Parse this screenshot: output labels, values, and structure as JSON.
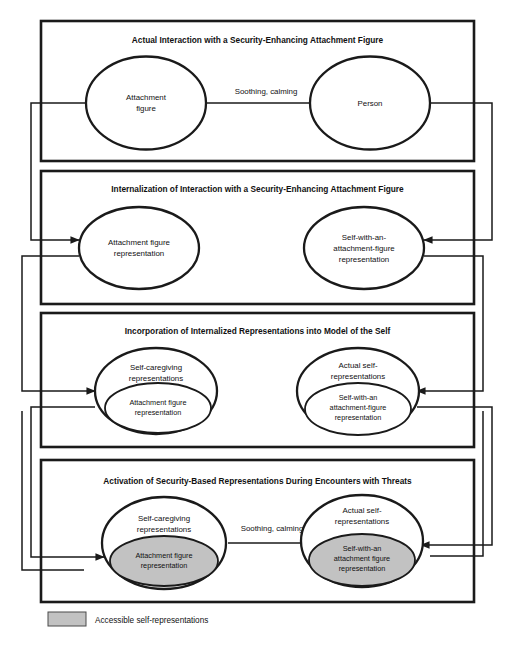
{
  "figure": {
    "type": "flow-diagram",
    "panel_count": 4,
    "colors": {
      "stroke": "#1a1a1a",
      "shaded_fill": "#c2c2c2",
      "background": "#ffffff"
    }
  },
  "panels": [
    {
      "id": "panel-1",
      "title": "Actual Interaction with a Security-Enhancing Attachment Figure",
      "left_node": {
        "lines": [
          "Attachment",
          "figure"
        ]
      },
      "right_node": {
        "lines": [
          "Person"
        ]
      },
      "edge_label": "Soothing, calming",
      "has_edge_arrow": true,
      "left_inner_node": null,
      "right_inner_node": null
    },
    {
      "id": "panel-2",
      "title": "Internalization of Interaction with a Security-Enhancing Attachment Figure",
      "left_node": {
        "lines": [
          "Attachment figure",
          "representation"
        ]
      },
      "right_node": {
        "lines": [
          "Self-with-an-",
          "attachment-figure",
          "representation"
        ]
      },
      "edge_label": null,
      "has_edge_arrow": false,
      "left_inner_node": null,
      "right_inner_node": null
    },
    {
      "id": "panel-3",
      "title": "Incorporation of Internalized Representations into Model of the Self",
      "left_node": {
        "lines": [
          "Self-caregiving",
          "representations"
        ]
      },
      "right_node": {
        "lines": [
          "Actual self-",
          "representations"
        ]
      },
      "edge_label": null,
      "has_edge_arrow": false,
      "left_inner_node": {
        "lines": [
          "Attachment figure",
          "representation"
        ],
        "shaded": false
      },
      "right_inner_node": {
        "lines": [
          "Self-with-an",
          "attachment-figure",
          "representation"
        ],
        "shaded": false
      }
    },
    {
      "id": "panel-4",
      "title": "Activation of Security-Based Representations During Encounters with Threats",
      "left_node": {
        "lines": [
          "Self-caregiving",
          "representations"
        ]
      },
      "right_node": {
        "lines": [
          "Actual self-",
          "representations"
        ]
      },
      "edge_label": "Soothing, calming",
      "has_edge_arrow": true,
      "left_inner_node": {
        "lines": [
          "Attachment figure",
          "representation"
        ],
        "shaded": true
      },
      "right_inner_node": {
        "lines": [
          "Self-with-an",
          "attachment figure",
          "representation"
        ],
        "shaded": true
      }
    }
  ],
  "legend": {
    "swatch_fill": "#c2c2c2",
    "label": "Accessible self-representations"
  }
}
